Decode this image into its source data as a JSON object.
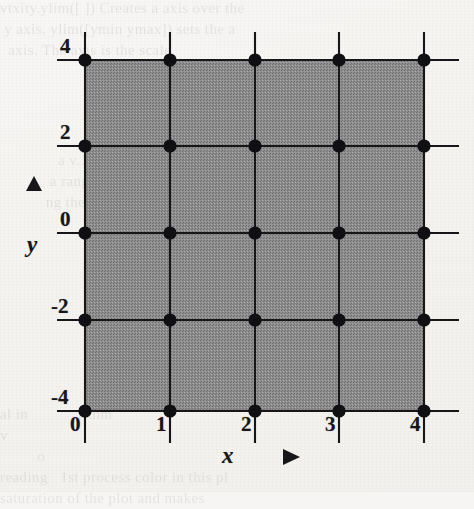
{
  "figure": {
    "kind": "cartesian-mesh-plot",
    "background_color": "#f6f5f3",
    "ink_color": "#17171a",
    "fill_color": "#8a8a8a",
    "node_count": 25
  },
  "axes": {
    "x": {
      "label": "x",
      "arrow_glyph": "right-triangle",
      "tick_labels": [
        "0",
        "1",
        "2",
        "3",
        "4"
      ],
      "values": [
        0,
        1,
        2,
        3,
        4
      ],
      "pixels": [
        85,
        170,
        255,
        339,
        424
      ]
    },
    "y": {
      "label": "y",
      "arrow_glyph": "up-triangle",
      "tick_labels": [
        "4",
        "2",
        "0",
        "-2",
        "-4"
      ],
      "values": [
        4,
        2,
        0,
        -2,
        -4
      ],
      "pixels": [
        60,
        146,
        233,
        320,
        411
      ]
    }
  },
  "chart_data": {
    "type": "scatter",
    "title": "",
    "xlabel": "x",
    "ylabel": "y",
    "grid": true,
    "legend": null,
    "xlim": [
      0,
      4
    ],
    "ylim": [
      -4,
      4
    ],
    "xticks": [
      0,
      1,
      2,
      3,
      4
    ],
    "xticklabels": [
      "0",
      "1",
      "2",
      "3",
      "4"
    ],
    "yticks": [
      -4,
      -2,
      0,
      2,
      4
    ],
    "yticklabels": [
      "-4",
      "-2",
      "0",
      "2",
      "4"
    ],
    "marker": "filled-circle",
    "series": [
      {
        "name": "mesh nodes",
        "points": [
          [
            0,
            4
          ],
          [
            1,
            4
          ],
          [
            2,
            4
          ],
          [
            3,
            4
          ],
          [
            4,
            4
          ],
          [
            0,
            2
          ],
          [
            1,
            2
          ],
          [
            2,
            2
          ],
          [
            3,
            2
          ],
          [
            4,
            2
          ],
          [
            0,
            0
          ],
          [
            1,
            0
          ],
          [
            2,
            0
          ],
          [
            3,
            0
          ],
          [
            4,
            0
          ],
          [
            0,
            -2
          ],
          [
            1,
            -2
          ],
          [
            2,
            -2
          ],
          [
            3,
            -2
          ],
          [
            4,
            -2
          ],
          [
            0,
            -4
          ],
          [
            1,
            -4
          ],
          [
            2,
            -4
          ],
          [
            3,
            -4
          ],
          [
            4,
            -4
          ]
        ]
      }
    ],
    "shaded_region": {
      "x_range": [
        0,
        4
      ],
      "y_range": [
        -4,
        4
      ],
      "fill": "#8a8a8a"
    }
  },
  "ghost_text": {
    "top": "vtxity.ylim([ ]) Creates a axis over the\n y axis. ylim([ymin ymax]) sets the a\n  axis. The axis is the scale\n                    the ent",
    "middle": "              a v.12\n            a ranges\n           ng the",
    "bottom": "al in            rithm\nv\n         o\nreading   1st process color in this pl\nsaturation of the plot and makes"
  }
}
